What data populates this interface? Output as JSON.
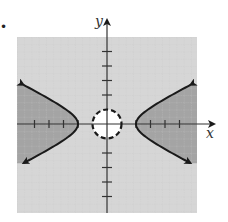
{
  "figure": {
    "marker": "•",
    "x_axis_label": "x",
    "y_axis_label": "y"
  },
  "colors": {
    "background": "#ffffff",
    "light_shade": "#d6d6d6",
    "dark_shade": "#a4a4a4",
    "grid_line": "#bcbcbc",
    "curve": "#1a1a1a"
  },
  "chart_data": {
    "type": "region",
    "title": "",
    "xlabel": "x",
    "ylabel": "y",
    "xlim": [
      -6.2,
      6.2
    ],
    "ylim": [
      -6.1,
      6.0
    ],
    "grid": true,
    "x_ticks": [
      -5,
      -4,
      -3,
      -2,
      -1,
      1,
      2,
      3,
      4,
      5
    ],
    "y_ticks": [
      -5,
      -4,
      -3,
      -2,
      -1,
      1,
      2,
      3,
      4,
      5
    ],
    "curves": [
      {
        "name": "hyperbola",
        "equation": "x^2/4 - y^2 = 1",
        "style": "solid",
        "vertices": [
          [
            -2,
            0
          ],
          [
            2,
            0
          ]
        ],
        "arrows": true,
        "shaded_side": "x^2/4 - y^2 >= 1 (outside branches, toward |x| large)"
      },
      {
        "name": "circle",
        "equation": "x^2 + y^2 = 1",
        "center": [
          0,
          0
        ],
        "radius": 1,
        "style": "dashed",
        "shaded_side": "x^2 + y^2 > 1 (exterior)"
      }
    ],
    "solution_region": "x^2/4 - y^2 >= 1 and x^2 + y^2 > 1 (darkest shading)"
  }
}
